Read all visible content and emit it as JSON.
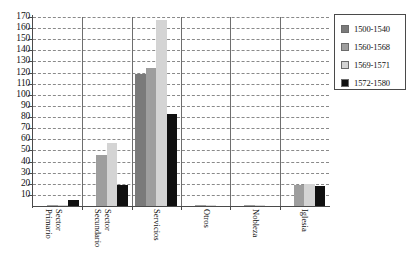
{
  "chart_data": {
    "type": "bar",
    "title": "",
    "xlabel": "",
    "ylabel": "",
    "ylim": [
      0,
      170
    ],
    "ytick_step": 10,
    "ytick_labels": [
      "170",
      "160",
      "150",
      "140",
      "130",
      "120",
      "110",
      "100",
      "90",
      "80",
      "70",
      "60",
      "50",
      "40",
      "30",
      "20",
      "10"
    ],
    "grid": true,
    "legend_position": "top-right",
    "categories": [
      "Sector Primario",
      "Sector Secundario",
      "Servicios",
      "Otros",
      "Nobleza",
      "Iglesia"
    ],
    "category_label_lines": [
      [
        "Sector",
        "Primario"
      ],
      [
        "Sector",
        "Secundario"
      ],
      [
        "Servicios"
      ],
      [
        "Otros"
      ],
      [
        "Nobleza"
      ],
      [
        "Iglesia"
      ]
    ],
    "series": [
      {
        "name": "1500-1540",
        "color": "#7a7a7a",
        "values": [
          0,
          0,
          119,
          0,
          0,
          0
        ]
      },
      {
        "name": "1560-1568",
        "color": "#9e9e9e",
        "values": [
          1,
          46,
          124,
          1,
          1,
          19
        ]
      },
      {
        "name": "1569-1571",
        "color": "#d4d4d4",
        "values": [
          1,
          57,
          167,
          1,
          1,
          20
        ]
      },
      {
        "name": "1572-1580",
        "color": "#101010",
        "values": [
          5,
          19,
          83,
          0,
          0,
          18
        ]
      }
    ]
  },
  "legend": {
    "entries": [
      {
        "label": "1500-1540",
        "color": "#7a7a7a"
      },
      {
        "label": "1560-1568",
        "color": "#9e9e9e"
      },
      {
        "label": "1569-1571",
        "color": "#d4d4d4"
      },
      {
        "label": "1572-1580",
        "color": "#101010"
      }
    ]
  }
}
